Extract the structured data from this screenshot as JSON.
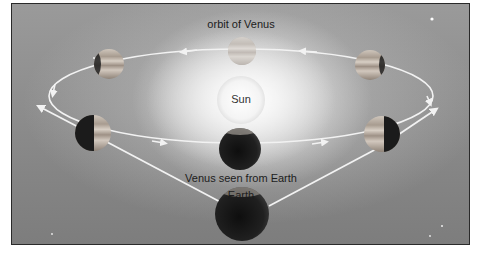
{
  "diagram": {
    "title_label": "orbit of Venus",
    "sun_label": "Sun",
    "venus_view_label": "Venus seen from Earth",
    "earth_label": "Earth",
    "colors": {
      "background": "#8e8e8e",
      "orbit_line": "#f2f2f2",
      "sun": "#f7f7f7",
      "frame_border": "#2a2a2a",
      "planet_dark": "#1e1e1e",
      "planet_light": "#d8d0c8"
    },
    "venus_positions": [
      {
        "name": "venus-top",
        "phase": "full"
      },
      {
        "name": "venus-upper-right",
        "phase": "gibbous"
      },
      {
        "name": "venus-right",
        "phase": "half"
      },
      {
        "name": "venus-bottom",
        "phase": "new"
      },
      {
        "name": "venus-left",
        "phase": "half"
      },
      {
        "name": "venus-upper-left",
        "phase": "gibbous"
      }
    ]
  }
}
